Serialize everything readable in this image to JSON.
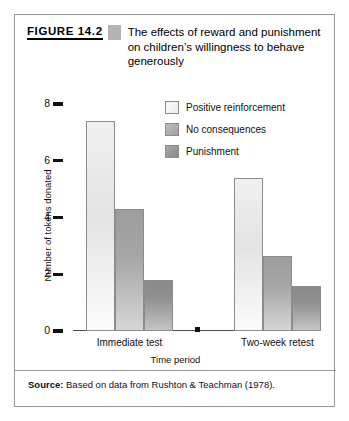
{
  "figure": {
    "number": "FIGURE 14.2",
    "title": "The effects of reward and punishment on children’s willingness to behave generously",
    "source_label": "Source:",
    "source_text": "Based on data from Rushton & Teachman (1978)."
  },
  "chart_data": {
    "type": "bar",
    "title": "The effects of reward and punishment on children’s willingness to behave generously",
    "xlabel": "Time period",
    "ylabel": "Number of tokens donated",
    "categories": [
      "Immediate test",
      "Two-week retest"
    ],
    "series": [
      {
        "name": "Positive reinforcement",
        "values": [
          7.4,
          5.4
        ],
        "color": "#ececec"
      },
      {
        "name": "No consequences",
        "values": [
          4.3,
          2.65
        ],
        "color": "#a6a6a6"
      },
      {
        "name": "Punishment",
        "values": [
          1.8,
          1.6
        ],
        "color": "#8d8d8d"
      }
    ],
    "ylim": [
      0,
      8
    ],
    "yticks": [
      0,
      2,
      4,
      6,
      8
    ],
    "ytick_labels": [
      "0",
      "2",
      "4",
      "6",
      "8"
    ],
    "grid": false,
    "legend_position": "upper right"
  }
}
